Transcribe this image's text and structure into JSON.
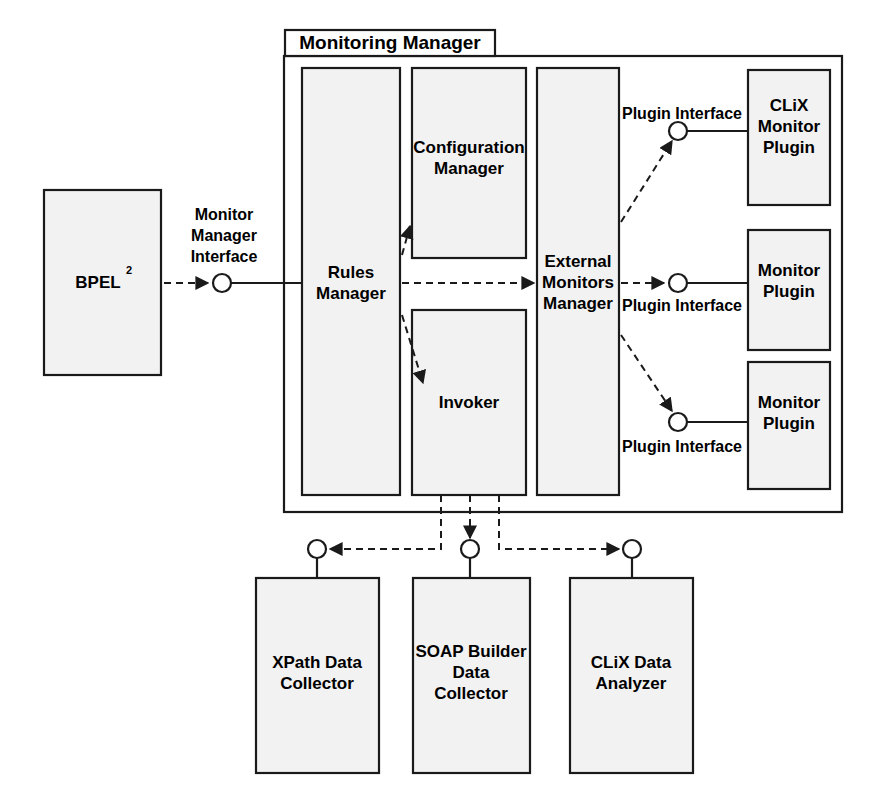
{
  "diagram": {
    "title": "Monitoring Manager",
    "container": {
      "label": "Monitoring Manager"
    },
    "external_components": [
      {
        "id": "bpel",
        "name": "BPEL",
        "superscript": "2",
        "full_label": "BPEL2"
      }
    ],
    "interfaces": [
      {
        "id": "monitor-manager-interface",
        "label_lines": [
          "Monitor",
          "Manager",
          "Interface"
        ],
        "label": "Monitor Manager Interface"
      },
      {
        "id": "plugin-interface-1",
        "label": "Plugin Interface"
      },
      {
        "id": "plugin-interface-2",
        "label": "Plugin Interface"
      },
      {
        "id": "plugin-interface-3",
        "label": "Plugin Interface"
      }
    ],
    "inner_components": [
      {
        "id": "rules-manager",
        "lines": [
          "Rules",
          "Manager"
        ],
        "label": "Rules Manager"
      },
      {
        "id": "configuration-manager",
        "lines": [
          "Configuration",
          "Manager"
        ],
        "label": "Configuration Manager"
      },
      {
        "id": "invoker",
        "lines": [
          "Invoker"
        ],
        "label": "Invoker"
      },
      {
        "id": "external-monitors-manager",
        "lines": [
          "External",
          "Monitors",
          "Manager"
        ],
        "label": "External Monitors Manager"
      }
    ],
    "plugins": [
      {
        "id": "clix-monitor-plugin",
        "lines": [
          "CLiX",
          "Monitor",
          "Plugin"
        ],
        "label": "CLiX Monitor Plugin"
      },
      {
        "id": "monitor-plugin-2",
        "lines": [
          "Monitor",
          "Plugin"
        ],
        "label": "Monitor Plugin"
      },
      {
        "id": "monitor-plugin-3",
        "lines": [
          "Monitor",
          "Plugin"
        ],
        "label": "Monitor Plugin"
      }
    ],
    "bottom_components": [
      {
        "id": "xpath-data-collector",
        "lines": [
          "XPath Data",
          "Collector"
        ],
        "label": "XPath Data Collector"
      },
      {
        "id": "soap-builder-data-collector",
        "lines": [
          "SOAP Builder",
          "Data",
          "Collector"
        ],
        "label": "SOAP Builder Data Collector"
      },
      {
        "id": "clix-data-analyzer",
        "lines": [
          "CLiX Data",
          "Analyzer"
        ],
        "label": "CLiX Data Analyzer"
      }
    ],
    "colors": {
      "box_fill": "#f2f2f2",
      "stroke": "#1a1a1a",
      "background": "#ffffff",
      "text": "#000000"
    }
  }
}
